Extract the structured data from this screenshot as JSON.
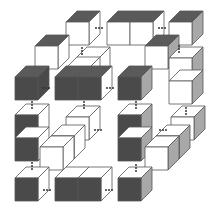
{
  "figure": {
    "colors": {
      "dark": "#4a4a4a",
      "top_dark": "#5a5a5a",
      "side_gray": "#a8a8a8",
      "white": "#ffffff",
      "line": "#555555",
      "dot": "#333333"
    },
    "cube": {
      "w": 23,
      "h": 23,
      "dx": 11,
      "dy": -11
    },
    "cubes": [
      {
        "x": 66,
        "y": 22,
        "front": "white",
        "top": "dark",
        "side": "white"
      },
      {
        "x": 107,
        "y": 22,
        "front": "white",
        "top": "dark",
        "side": "white"
      },
      {
        "x": 130,
        "y": 22,
        "front": "white",
        "top": "dark",
        "side": "white"
      },
      {
        "x": 169,
        "y": 22,
        "front": "white",
        "top": "dark",
        "side": "gray"
      },
      {
        "x": 35,
        "y": 46,
        "front": "white",
        "top": "dark",
        "side": "white"
      },
      {
        "x": 145,
        "y": 46,
        "front": "white",
        "top": "dark",
        "side": "gray"
      },
      {
        "x": 169,
        "y": 58,
        "front": "white",
        "top": "white",
        "side": "gray"
      },
      {
        "x": 169,
        "y": 81,
        "front": "white",
        "top": "white",
        "side": "gray"
      },
      {
        "x": 15,
        "y": 77,
        "front": "dark",
        "top": "dark",
        "side": "dark"
      },
      {
        "x": 55,
        "y": 77,
        "front": "dark",
        "top": "dark",
        "side": "dark"
      },
      {
        "x": 78,
        "y": 77,
        "front": "dark",
        "top": "dark",
        "side": "white"
      },
      {
        "x": 118,
        "y": 77,
        "front": "dark",
        "top": "dark",
        "side": "gray"
      },
      {
        "x": 66,
        "y": 68,
        "front": "white",
        "top": "white",
        "side": "white",
        "flat": true
      },
      {
        "x": 76,
        "y": 58,
        "front": "white",
        "top": "white",
        "side": "white",
        "flat": true
      },
      {
        "x": 15,
        "y": 115,
        "front": "dark",
        "top": "white",
        "side": "white"
      },
      {
        "x": 15,
        "y": 138,
        "front": "dark",
        "top": "white",
        "side": "white"
      },
      {
        "x": 66,
        "y": 117,
        "front": "white",
        "top": "white",
        "side": "white"
      },
      {
        "x": 118,
        "y": 115,
        "front": "dark",
        "top": "white",
        "side": "gray"
      },
      {
        "x": 118,
        "y": 138,
        "front": "dark",
        "top": "white",
        "side": "gray"
      },
      {
        "x": 171,
        "y": 117,
        "front": "white",
        "top": "white",
        "side": "gray"
      },
      {
        "x": 40,
        "y": 147,
        "front": "white",
        "top": "white",
        "side": "white"
      },
      {
        "x": 51,
        "y": 136,
        "front": "white",
        "top": "white",
        "side": "white"
      },
      {
        "x": 145,
        "y": 147,
        "front": "white",
        "top": "white",
        "side": "gray"
      },
      {
        "x": 156,
        "y": 136,
        "front": "white",
        "top": "white",
        "side": "gray"
      },
      {
        "x": 15,
        "y": 178,
        "front": "dark",
        "top": "white",
        "side": "white"
      },
      {
        "x": 55,
        "y": 178,
        "front": "dark",
        "top": "white",
        "side": "white"
      },
      {
        "x": 78,
        "y": 178,
        "front": "dark",
        "top": "white",
        "side": "white"
      },
      {
        "x": 118,
        "y": 178,
        "front": "dark",
        "top": "white",
        "side": "gray"
      }
    ],
    "connectors": [
      {
        "orient": "h",
        "x": 96,
        "y": 28
      },
      {
        "orient": "h",
        "x": 159,
        "y": 28
      },
      {
        "orient": "v",
        "x": 82,
        "y": 48
      },
      {
        "orient": "v",
        "x": 179,
        "y": 46
      },
      {
        "orient": "h",
        "x": 43,
        "y": 88
      },
      {
        "orient": "h",
        "x": 107,
        "y": 88
      },
      {
        "orient": "v",
        "x": 32,
        "y": 102
      },
      {
        "orient": "v",
        "x": 84,
        "y": 102
      },
      {
        "orient": "v",
        "x": 136,
        "y": 102
      },
      {
        "orient": "v",
        "x": 186,
        "y": 108
      },
      {
        "orient": "h",
        "x": 95,
        "y": 130
      },
      {
        "orient": "h",
        "x": 160,
        "y": 130
      },
      {
        "orient": "v",
        "x": 32,
        "y": 163
      },
      {
        "orient": "v",
        "x": 136,
        "y": 165
      },
      {
        "orient": "h",
        "x": 44,
        "y": 190
      },
      {
        "orient": "h",
        "x": 106,
        "y": 190
      }
    ]
  }
}
